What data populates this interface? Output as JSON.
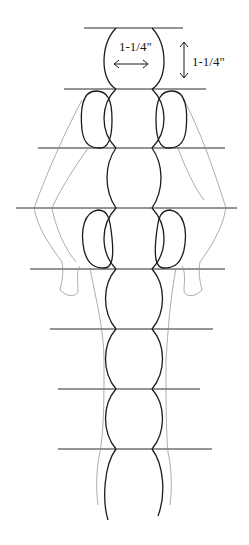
{
  "diagram": {
    "type": "pattern-figure",
    "labels": {
      "width_dimension": "1-1/4\"",
      "height_dimension": "1-1/4\""
    },
    "guide_lines": [
      {
        "y": 28,
        "x1": 84,
        "x2": 183
      },
      {
        "y": 89,
        "x1": 64,
        "x2": 206
      },
      {
        "y": 148,
        "x1": 38,
        "x2": 225
      },
      {
        "y": 208,
        "x1": 16,
        "x2": 237
      },
      {
        "y": 269,
        "x1": 30,
        "x2": 225
      },
      {
        "y": 329,
        "x1": 50,
        "x2": 213
      },
      {
        "y": 389,
        "x1": 58,
        "x2": 200
      },
      {
        "y": 449,
        "x1": 58,
        "x2": 212
      }
    ],
    "segments": {
      "head": {
        "label": "head"
      },
      "body_count": 7,
      "side_pads": [
        "upper-left",
        "upper-right",
        "middle-left",
        "middle-right"
      ]
    },
    "colors": {
      "line": "#1c1c1c",
      "faint_outline": "#8a8a8a",
      "background": "#ffffff"
    }
  }
}
